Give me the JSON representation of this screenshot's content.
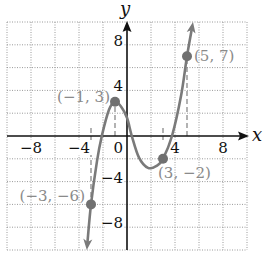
{
  "chart_data": {
    "type": "line",
    "title": "",
    "xlabel": "x",
    "ylabel": "y",
    "xlim": [
      -10,
      10
    ],
    "ylim": [
      -10,
      10
    ],
    "grid": true,
    "grid_step": 2,
    "x_ticks": [
      -8,
      -4,
      0,
      4,
      8
    ],
    "x_tick_labels": [
      "−8",
      "−4",
      "0",
      "4",
      "8"
    ],
    "y_ticks": [
      8,
      4,
      -4,
      -8
    ],
    "y_tick_labels": [
      "8",
      "4",
      "−4",
      "−8"
    ],
    "series": [
      {
        "name": "curve",
        "color": "#7a7a7a",
        "arrows_both_ends": true,
        "x": [
          -3.35,
          -3,
          -2.5,
          -2.1,
          -1.5,
          -1,
          -0.5,
          0,
          0.4,
          1,
          1.75,
          2.5,
          3,
          3.75,
          4.5,
          5,
          5.5
        ],
        "y": [
          -10,
          -6,
          -2.2,
          0,
          2.3,
          3,
          2.6,
          1.6,
          0,
          -1.9,
          -2.8,
          -2.6,
          -2,
          0,
          3.5,
          7,
          10
        ]
      }
    ],
    "labeled_points": [
      {
        "x": -1,
        "y": 3,
        "label": "(−1, 3)"
      },
      {
        "x": 3,
        "y": -2,
        "label": "(3, −2)"
      },
      {
        "x": -3,
        "y": -6,
        "label": "(−3, −6)"
      },
      {
        "x": 5,
        "y": 7,
        "label": "(5, 7)"
      }
    ],
    "annotations": [
      "dashed vertical guides from x-axis to each labeled point"
    ]
  },
  "axes": {
    "x_title": "x",
    "y_title": "y"
  }
}
